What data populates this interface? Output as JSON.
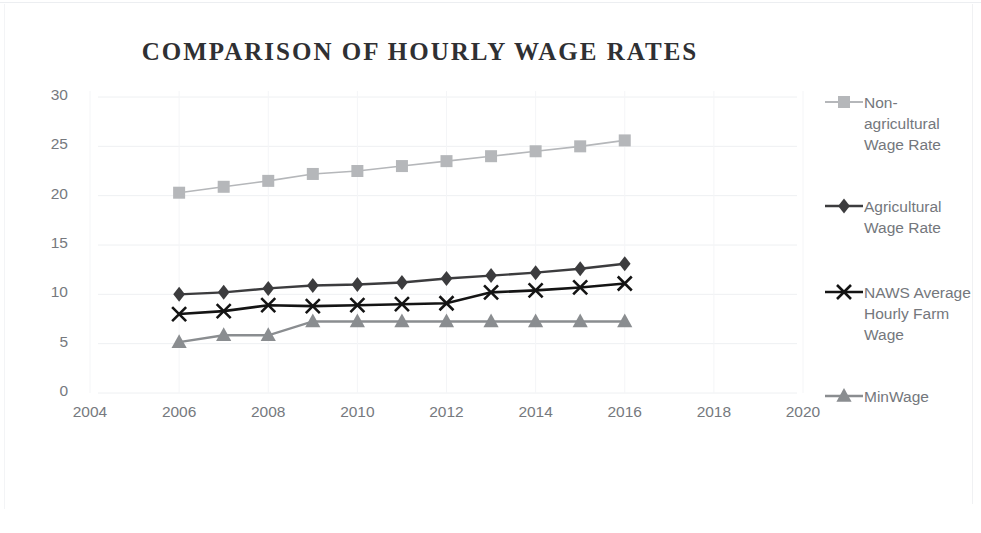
{
  "chart_data": {
    "type": "line",
    "title": "COMPARISON OF HOURLY WAGE RATES",
    "xlabel": "",
    "ylabel": "",
    "xlim": [
      2004,
      2020
    ],
    "ylim": [
      0,
      30
    ],
    "yticks": [
      0,
      5,
      10,
      15,
      20,
      25,
      30
    ],
    "xticks": [
      2004,
      2006,
      2008,
      2010,
      2012,
      2014,
      2016,
      2018,
      2020
    ],
    "grid": true,
    "legend_position": "right",
    "x": [
      2006,
      2007,
      2008,
      2009,
      2010,
      2011,
      2012,
      2013,
      2014,
      2015,
      2016
    ],
    "series": [
      {
        "name": "Non-agricultural Wage Rate",
        "marker": "square",
        "color": "#b5b7ba",
        "values": [
          20.3,
          20.9,
          21.5,
          22.2,
          22.5,
          23.0,
          23.5,
          24.0,
          24.5,
          25.0,
          25.6
        ]
      },
      {
        "name": "Agricultural Wage Rate",
        "marker": "diamond",
        "color": "#3c3c3e",
        "values": [
          10.0,
          10.2,
          10.6,
          10.9,
          11.0,
          11.2,
          11.6,
          11.9,
          12.2,
          12.6,
          13.1
        ]
      },
      {
        "name": "NAWS Average Hourly Farm Wage",
        "marker": "x",
        "color": "#141414",
        "values": [
          8.0,
          8.3,
          8.9,
          8.8,
          8.9,
          9.0,
          9.1,
          10.2,
          10.4,
          10.7,
          11.1
        ]
      },
      {
        "name": "MinWage",
        "marker": "triangle",
        "color": "#8a8d90",
        "values": [
          5.15,
          5.85,
          5.85,
          7.25,
          7.25,
          7.25,
          7.25,
          7.25,
          7.25,
          7.25,
          7.25
        ]
      }
    ]
  },
  "legend": {
    "entries": [
      {
        "label": "Non-agricultural Wage Rate"
      },
      {
        "label": "Agricultural Wage Rate"
      },
      {
        "label": "NAWS Average Hourly Farm Wage"
      },
      {
        "label": "MinWage"
      }
    ]
  },
  "axis": {
    "y_labels": [
      "30",
      "25",
      "20",
      "15",
      "10",
      "5",
      "0"
    ],
    "x_labels": [
      "2004",
      "2006",
      "2008",
      "2010",
      "2012",
      "2014",
      "2016",
      "2018",
      "2020"
    ]
  }
}
